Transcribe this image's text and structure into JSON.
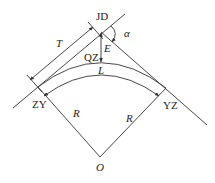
{
  "diagram": {
    "labels": {
      "jd": "JD",
      "alpha": "α",
      "t": "T",
      "e": "E",
      "qz": "QZ",
      "l": "L",
      "zy": "ZY",
      "yz": "YZ",
      "r_left": "R",
      "r_right": "R",
      "o": "O"
    },
    "colors": {
      "line": "#333333",
      "text": "#222222",
      "background": "#ffffff"
    }
  }
}
